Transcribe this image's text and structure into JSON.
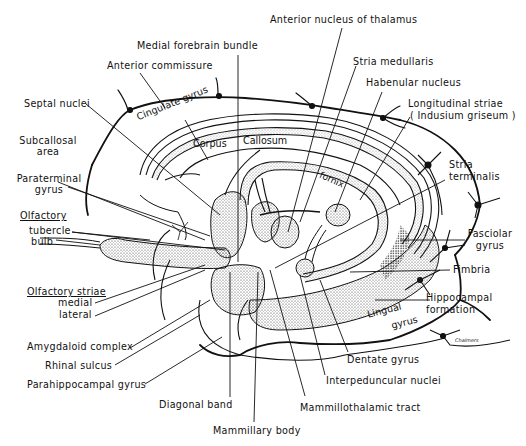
{
  "diagram": {
    "labels": {
      "anterior_nucleus_thalamus": "Anterior nucleus of thalamus",
      "medial_forebrain_bundle": "Medial forebrain bundle",
      "stria_medullaris": "Stria medullaris",
      "anterior_commissure": "Anterior commissure",
      "habenular_nucleus": "Habenular nucleus",
      "longitudinal_striae_1": "Longitudinal striae",
      "longitudinal_striae_2": "( Indusium griseum )",
      "septal_nuclei": "Septal nuclei",
      "cingulate_gyrus": "Cingulate  gyrus",
      "subcallosal_area_1": "Subcallosal",
      "subcallosal_area_2": "area",
      "corpus": "Corpus",
      "callosum": "Callosum",
      "fornix": "fornix",
      "stria_terminalis_1": "Stria",
      "stria_terminalis_2": "terminalis",
      "paraterminal_gyrus_1": "Paraterminal",
      "paraterminal_gyrus_2": "gyrus",
      "olfactory": "Olfactory",
      "tubercle": "tubercle",
      "bulb": "bulb",
      "fasciolar_gyrus_1": "Fasciolar",
      "fasciolar_gyrus_2": "gyrus",
      "olfactory_striae": "Olfactory  striae",
      "medial": "medial",
      "lateral": "lateral",
      "fimbria": "Fimbria",
      "hippocampal_formation_1": "Hippocampal",
      "hippocampal_formation_2": "formation",
      "lingual_gyrus_1": "Lingual",
      "lingual_gyrus_2": "gyrus",
      "amygdaloid_complex": "Amygdaloid  complex",
      "rhinal_sulcus": "Rhinal  sulcus",
      "dentate_gyrus": "Dentate  gyrus",
      "parahippocampal_gyrus": "Parahippocampal  gyrus",
      "interpeduncular_nuclei": "Interpeduncular  nuclei",
      "diagonal_band": "Diagonal  band",
      "mammillothalamic_tract": "Mammillothalamic  tract",
      "mammillary_body": "Mammillary  body"
    },
    "signature": "Chalmers"
  }
}
